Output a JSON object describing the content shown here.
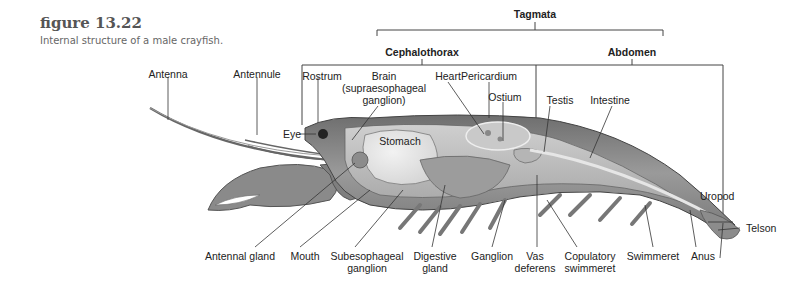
{
  "figure": {
    "number": "figure 13.22",
    "caption": "Internal structure of a male crayfish."
  },
  "tagmata": {
    "title": "Tagmata",
    "groups": [
      "Cephalothorax",
      "Abdomen"
    ]
  },
  "labels": {
    "antenna": "Antenna",
    "antennule": "Antennule",
    "rostrum": "Rostrum",
    "brain_1": "Brain",
    "brain_2": "(supraesophageal",
    "brain_3": "ganglion)",
    "heart": "Heart",
    "pericardium": "Pericardium",
    "ostium": "Ostium",
    "eye": "Eye",
    "stomach": "Stomach",
    "testis": "Testis",
    "intestine": "Intestine",
    "uropod": "Uropod",
    "telson": "Telson",
    "antennal_gland": "Antennal gland",
    "mouth": "Mouth",
    "subesophageal_1": "Subesophageal",
    "subesophageal_2": "ganglion",
    "digestive_1": "Digestive",
    "digestive_2": "gland",
    "ganglion": "Ganglion",
    "vas_1": "Vas",
    "vas_2": "deferens",
    "copulatory_1": "Copulatory",
    "copulatory_2": "swimmeret",
    "swimmeret": "Swimmeret",
    "anus": "Anus"
  }
}
